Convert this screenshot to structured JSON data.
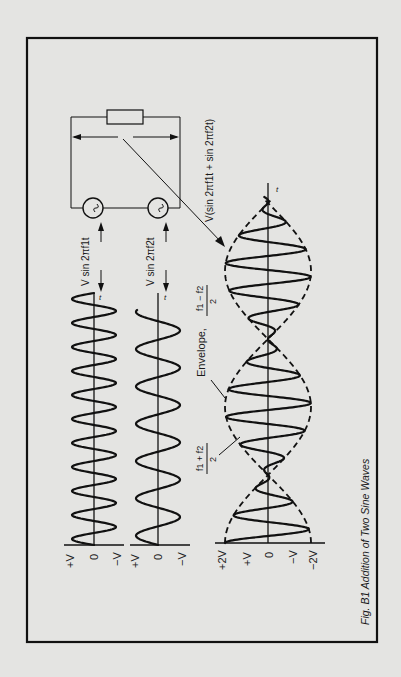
{
  "figure": {
    "caption": "Fig. B1 Addition of Two Sine Waves",
    "orientation": "rotated 90° counter-clockwise (time axis runs bottom-to-top)"
  },
  "circuit": {
    "sum_label": "V(sin 2πf1t + sin 2πf2t)",
    "sources": [
      {
        "symbol": "~",
        "label": "V sin 2πf1t"
      },
      {
        "symbol": "~",
        "label": "V sin 2πf2t"
      }
    ],
    "load": "resistor"
  },
  "panels": [
    {
      "name": "wave-f1",
      "formula": "V sin 2πf1t",
      "time_label": "t",
      "axis_labels": [
        "+V",
        "0",
        "−V"
      ],
      "cycles": 10.5
    },
    {
      "name": "wave-f2",
      "formula": "V sin 2πf2t",
      "time_label": "t",
      "axis_labels": [
        "+V",
        "0",
        "−V"
      ],
      "cycles": 6.3
    },
    {
      "name": "wave-sum",
      "formula": "V(sin 2πf1t + sin 2πf2t)",
      "time_label": "t",
      "axis_labels": [
        "+2V",
        "+V",
        "0",
        "−V",
        "−2V"
      ],
      "envelope_label": "Envelope,",
      "envelope_freq_num": "f1 − f2",
      "envelope_freq_den": "2",
      "carrier_freq_num": "f1 + f2",
      "carrier_freq_den": "2"
    }
  ],
  "colors": {
    "paper": "#e4e4e2",
    "ink": "#111111"
  }
}
